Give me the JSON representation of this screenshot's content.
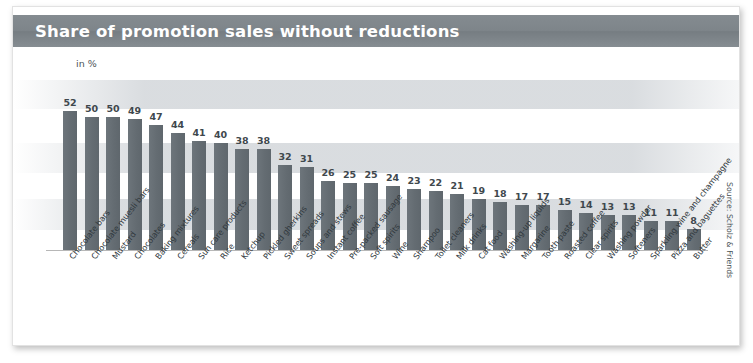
{
  "card": {
    "title": "Share of promotion sales without reductions",
    "source": "Source: Scholz & Friends",
    "unit_label": "in %",
    "accent_color": "#7e858a",
    "bar_color": "#646c72",
    "band_color": "#d0d4d8"
  },
  "chart_data": {
    "type": "bar",
    "title": "Share of promotion sales without reductions",
    "subtitle": "",
    "xlabel": "",
    "ylabel": "in %",
    "ylim": [
      0,
      56
    ],
    "grid": false,
    "legend": null,
    "annotations": [
      "in %",
      "Source: Scholz & Friends"
    ],
    "value_labels_shown": true,
    "categories": [
      "Chocolate bars",
      "Chocolate muesli bars",
      "Mustard",
      "Chocolates",
      "Baking mixtures",
      "Cereals",
      "Sun care products",
      "Rice",
      "Ketchup",
      "Pickled gherkins",
      "Sweet spreads",
      "Soups and stews",
      "Instant coffee",
      "Pre-packed sausage",
      "Soft spirits",
      "Wine",
      "Shampoo",
      "Toilet cleaners",
      "Milk drinks",
      "Cat food",
      "Washing-up liquids",
      "Margarine",
      "Tooth paste",
      "Roasted coffee",
      "Clear spirits",
      "Washing powder",
      "Softeners",
      "Sparkling wine and champagne",
      "Pizza and baguettes",
      "Butter"
    ],
    "values": [
      52,
      50,
      50,
      49,
      47,
      44,
      41,
      40,
      38,
      38,
      32,
      31,
      26,
      25,
      25,
      24,
      23,
      22,
      21,
      19,
      18,
      17,
      17,
      15,
      14,
      13,
      13,
      11,
      11,
      8
    ]
  }
}
